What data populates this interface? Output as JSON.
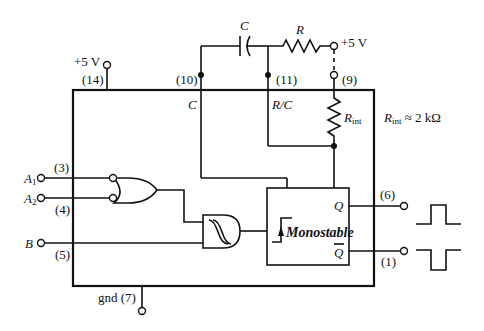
{
  "diagram": {
    "labels": {
      "vcc_top_left": "+5 V",
      "vcc_top_right": "+5 V",
      "pin14": "(14)",
      "pin10": "(10)",
      "pin11": "(11)",
      "pin9": "(9)",
      "pin3": "(3)",
      "pin4": "(4)",
      "pin5": "(5)",
      "pin6": "(6)",
      "pin1": "(1)",
      "gnd": "gnd (7)",
      "cap": "C",
      "res": "R",
      "c_internal": "C",
      "rc_internal": "R/C",
      "rint": "R",
      "rint_sub": "int",
      "rint_note_r": "R",
      "rint_note_sub": "int",
      "rint_note_val": " ≈ 2 kΩ",
      "a1": "A",
      "a1_sub": "1",
      "a2": "A",
      "a2_sub": "2",
      "b": "B",
      "q": "Q",
      "qbar": "Q",
      "monostable": "Monostable"
    },
    "components": [
      {
        "type": "external-capacitor",
        "label": "C",
        "between": [
          "pin10",
          "pin11"
        ]
      },
      {
        "type": "external-resistor",
        "label": "R",
        "between": [
          "pin11",
          "+5 V"
        ]
      },
      {
        "type": "internal-resistor",
        "label": "Rint",
        "value": "≈ 2 kΩ",
        "between": [
          "pin9",
          "R/C"
        ]
      },
      {
        "type": "or-gate",
        "inputs": [
          "A1 (3) inverted",
          "A2 (4) inverted"
        ]
      },
      {
        "type": "schmitt-and-gate",
        "inputs": [
          "OR output",
          "B (5)"
        ]
      },
      {
        "type": "monostable",
        "outputs": [
          "Q (6)",
          "Q̄ (1)"
        ]
      }
    ],
    "waveforms": [
      {
        "output": "Q",
        "shape": "positive pulse"
      },
      {
        "output": "Q̄",
        "shape": "negative pulse"
      }
    ]
  }
}
